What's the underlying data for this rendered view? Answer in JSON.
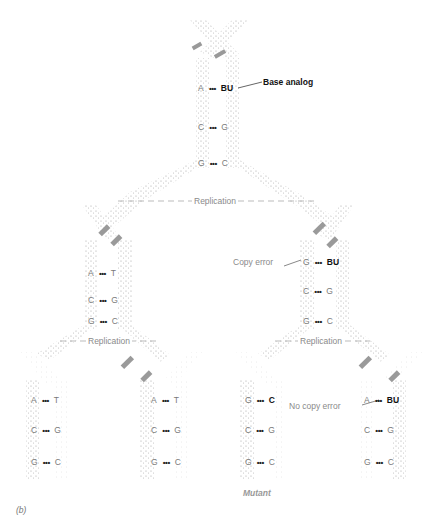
{
  "figure": {
    "panel_label": "(b)",
    "colors": {
      "strand_stipple": "#b0b0b0",
      "label_gray": "#8a8a8a",
      "label_dark": "#111111"
    },
    "top": {
      "pairs": [
        {
          "left": "A",
          "dots": "•••",
          "right": "BU",
          "right_bold": true
        },
        {
          "left": "C",
          "dots": "•••",
          "right": "G"
        },
        {
          "left": "G",
          "dots": "•••",
          "right": "C"
        }
      ],
      "callout": "Base analog"
    },
    "replication_label": "Replication",
    "middle_left": {
      "pairs": [
        {
          "left": "A",
          "dots": "•••",
          "right": "T"
        },
        {
          "left": "C",
          "dots": "•••",
          "right": "G"
        },
        {
          "left": "G",
          "dots": "•••",
          "right": "C"
        }
      ]
    },
    "middle_right": {
      "pairs": [
        {
          "left": "G",
          "dots": "•••",
          "right": "BU",
          "right_bold": true
        },
        {
          "left": "C",
          "dots": "•••",
          "right": "G"
        },
        {
          "left": "G",
          "dots": "•••",
          "right": "C"
        }
      ],
      "callout": "Copy error"
    },
    "bottom": [
      {
        "pairs": [
          {
            "left": "A",
            "dots": "•••",
            "right": "T"
          },
          {
            "left": "C",
            "dots": "•••",
            "right": "G"
          },
          {
            "left": "G",
            "dots": "•••",
            "right": "C"
          }
        ]
      },
      {
        "pairs": [
          {
            "left": "A",
            "dots": "•••",
            "right": "T"
          },
          {
            "left": "C",
            "dots": "•••",
            "right": "G"
          },
          {
            "left": "G",
            "dots": "•••",
            "right": "C"
          }
        ]
      },
      {
        "pairs": [
          {
            "left": "G",
            "dots": "•••",
            "right": "C",
            "right_bold": true
          },
          {
            "left": "C",
            "dots": "•••",
            "right": "G"
          },
          {
            "left": "G",
            "dots": "•••",
            "right": "C"
          }
        ],
        "label": "Mutant"
      },
      {
        "pairs": [
          {
            "left": "A",
            "dots": "•••",
            "right": "BU",
            "right_bold": true
          },
          {
            "left": "C",
            "dots": "•••",
            "right": "G"
          },
          {
            "left": "G",
            "dots": "•••",
            "right": "C"
          }
        ],
        "callout": "No copy error"
      }
    ]
  }
}
